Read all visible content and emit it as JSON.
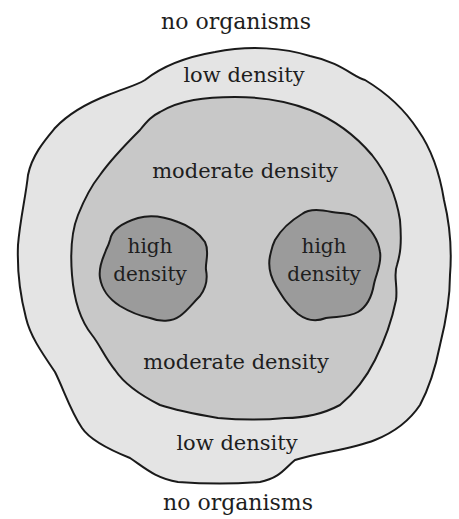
{
  "diagram": {
    "labels": {
      "top_outside": "no organisms",
      "low_top": "low density",
      "moderate_top": "moderate density",
      "high_left_line1": "high",
      "high_left_line2": "density",
      "high_right_line1": "high",
      "high_right_line2": "density",
      "moderate_bottom": "moderate density",
      "low_bottom": "low density",
      "bottom_outside": "no organisms"
    },
    "colors": {
      "background": "#ffffff",
      "low_density_fill": "#e4e4e4",
      "moderate_density_fill": "#c8c8c8",
      "high_density_fill": "#9b9b9b",
      "outline": "#1a1a1a"
    },
    "zones": [
      {
        "name": "no organisms",
        "level": 0
      },
      {
        "name": "low density",
        "level": 1
      },
      {
        "name": "moderate density",
        "level": 2
      },
      {
        "name": "high density",
        "level": 3,
        "count": 2
      }
    ]
  }
}
